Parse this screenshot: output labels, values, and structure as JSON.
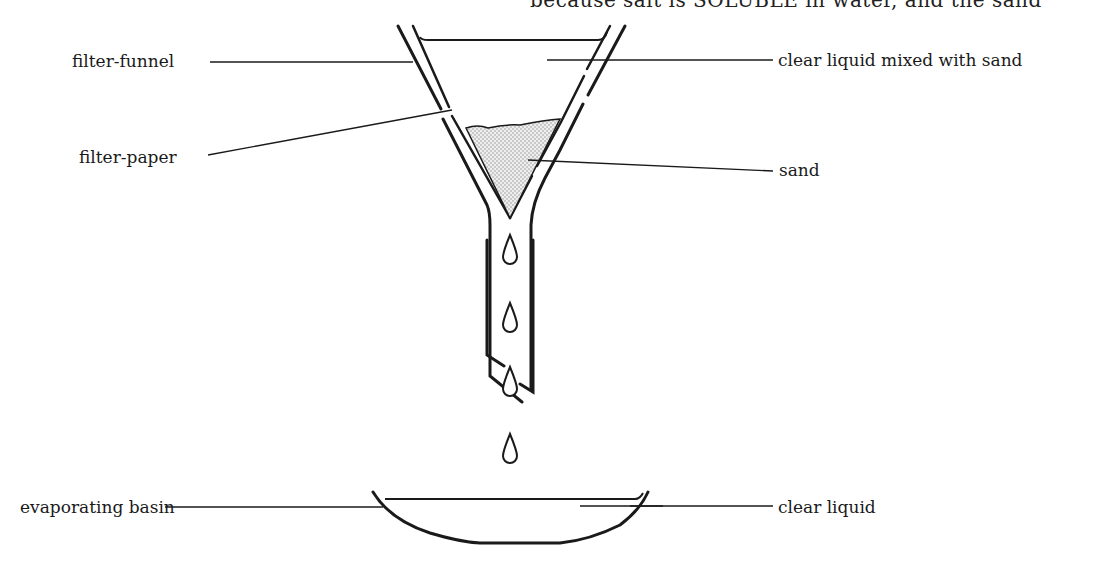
{
  "header_fragment": "because salt is SOLUBLE in water, and the sand",
  "labels": {
    "filter_funnel": "filter-funnel",
    "filter_paper": "filter-paper",
    "clear_liquid_mixed_with_sand": "clear liquid mixed with sand",
    "sand": "sand",
    "evaporating_basin": "evaporating basin",
    "clear_liquid": "clear liquid"
  },
  "colors": {
    "ink": "#1a1a1a",
    "sand_fill": "#d9d9d9",
    "background": "#ffffff"
  }
}
